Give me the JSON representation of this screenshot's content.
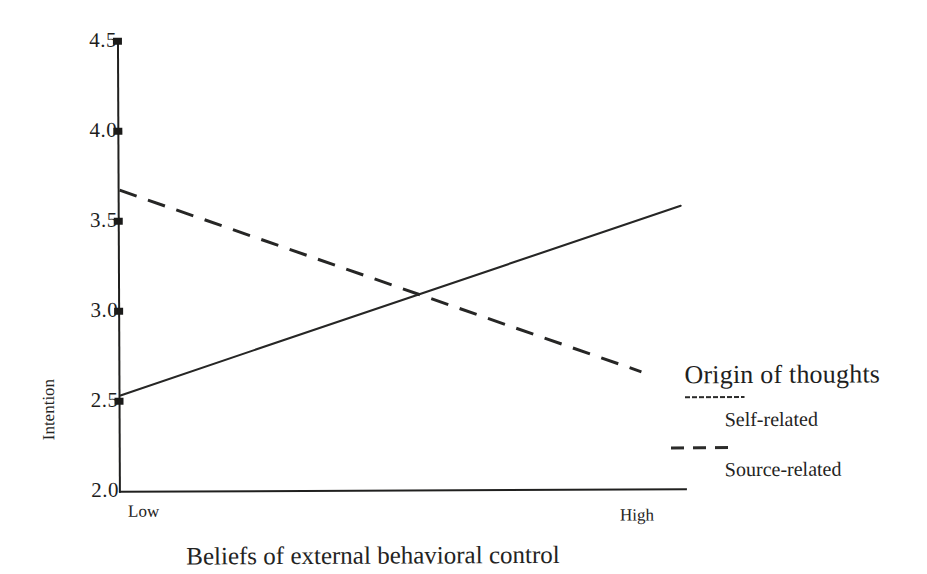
{
  "chart_data": {
    "type": "line",
    "title": "",
    "xlabel": "Beliefs of external behavioral control",
    "ylabel": "Intention",
    "categories": [
      "Low",
      "High"
    ],
    "x": [
      0,
      1
    ],
    "ylim": [
      2.0,
      4.5
    ],
    "yticks": [
      "2.0",
      "2.5",
      "3.0",
      "3.5",
      "4.0",
      "4.5"
    ],
    "ytick_values": [
      2.0,
      2.5,
      3.0,
      3.5,
      4.0,
      4.5
    ],
    "grid": false,
    "legend_position": "right",
    "legend_title": "Origin of thoughts",
    "crossing_point": {
      "x": 0.52,
      "y": 3.05
    },
    "series": [
      {
        "name": "Self-related",
        "style": "solid",
        "values": [
          2.53,
          3.57
        ]
      },
      {
        "name": "Source-related",
        "style": "dashed",
        "values": [
          3.67,
          2.57
        ]
      }
    ]
  },
  "axes": {
    "y_ticks": [
      {
        "label": "4.5",
        "value": 4.5
      },
      {
        "label": "4.0",
        "value": 4.0
      },
      {
        "label": "3.5",
        "value": 3.5
      },
      {
        "label": "3.0",
        "value": 3.0
      },
      {
        "label": "2.5",
        "value": 2.5
      },
      {
        "label": "2.0",
        "value": 2.0
      }
    ],
    "y_title": "Intention",
    "x_categories": [
      {
        "label": "Low"
      },
      {
        "label": "High"
      }
    ],
    "x_title": "Beliefs of external behavioral control"
  },
  "legend": {
    "title": "Origin of thoughts",
    "entries": [
      {
        "label": "Self-related",
        "style": "solid"
      },
      {
        "label": "Source-related",
        "style": "dashed"
      }
    ]
  },
  "colors": {
    "ink": "#20201f",
    "background": "#ffffff"
  }
}
